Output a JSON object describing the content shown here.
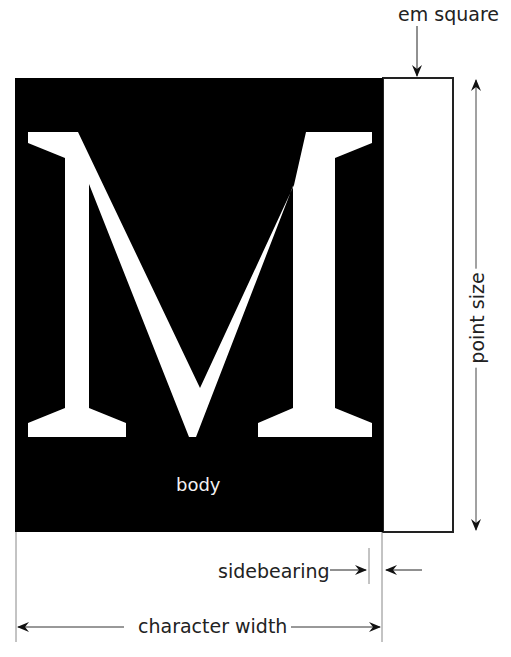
{
  "diagram": {
    "glyph": "M",
    "labels": {
      "em_square": "em square",
      "body": "body",
      "point_size": "point size",
      "sidebearing": "sidebearing",
      "character_width": "character width"
    },
    "colors": {
      "body_fill": "#000000",
      "glyph_fill": "#ffffff",
      "line": "#222222",
      "background": "#ffffff"
    }
  }
}
